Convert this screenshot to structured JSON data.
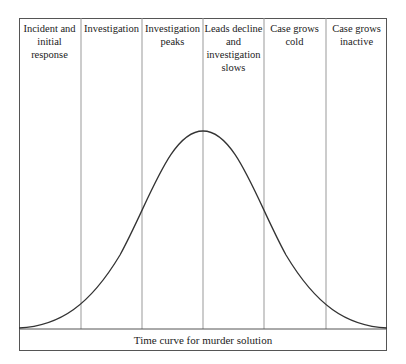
{
  "diagram": {
    "columns": [
      {
        "label": "Incident and initial response"
      },
      {
        "label": "Investigation"
      },
      {
        "label": "Investigation peaks"
      },
      {
        "label": "Leads decline and investigation slows"
      },
      {
        "label": "Case grows cold"
      },
      {
        "label": "Case grows inactive"
      }
    ],
    "caption": "Time curve for murder solution",
    "curve": {
      "shape": "bell",
      "peak_column_boundary": 3
    },
    "colors": {
      "line": "#333333",
      "grid": "#999999",
      "text": "#222222"
    }
  }
}
